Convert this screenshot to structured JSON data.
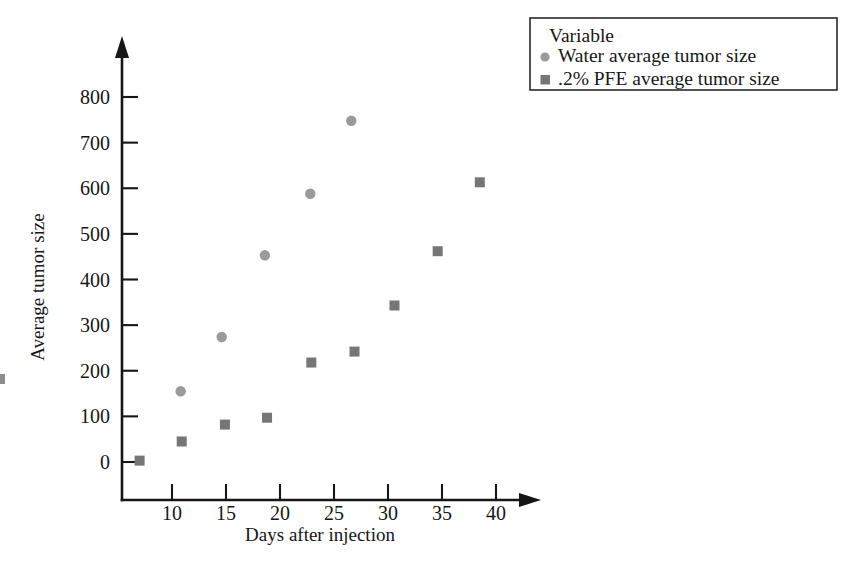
{
  "chart_data": {
    "type": "scatter",
    "title": "",
    "xlabel": "Days after injection",
    "ylabel": "Average tumor size",
    "xlim": [
      5,
      43
    ],
    "ylim": [
      -40,
      860
    ],
    "xticks": [
      10,
      15,
      20,
      25,
      30,
      35,
      40
    ],
    "yticks": [
      0,
      100,
      200,
      300,
      400,
      500,
      600,
      700,
      800
    ],
    "grid": false,
    "legend_position": "top-right",
    "legend_title": "Variable",
    "series": [
      {
        "name": "Water average tumor size",
        "marker": "circle",
        "color": "#9a9a9a",
        "points": [
          {
            "x": 10.8,
            "y": 155
          },
          {
            "x": 14.6,
            "y": 274
          },
          {
            "x": 18.6,
            "y": 453
          },
          {
            "x": 22.8,
            "y": 588
          },
          {
            "x": 26.6,
            "y": 748
          }
        ]
      },
      {
        "name": ".2% PFE average tumor size",
        "marker": "square",
        "color": "#767676",
        "points": [
          {
            "x": 7.0,
            "y": 3
          },
          {
            "x": 10.9,
            "y": 45
          },
          {
            "x": 14.9,
            "y": 82
          },
          {
            "x": 18.8,
            "y": 97
          },
          {
            "x": 22.9,
            "y": 218
          },
          {
            "x": 26.9,
            "y": 242
          },
          {
            "x": 30.6,
            "y": 343
          },
          {
            "x": 34.6,
            "y": 462
          },
          {
            "x": 38.5,
            "y": 613
          }
        ]
      }
    ]
  },
  "legend": {
    "title": "Variable",
    "entries": [
      {
        "label": "Water average tumor size",
        "marker": "circle",
        "color": "#9a9a9a"
      },
      {
        "label": ".2% PFE average tumor size",
        "marker": "square",
        "color": "#767676"
      }
    ]
  },
  "axes": {
    "x_title": "Days after injection",
    "y_title": "Average tumor size",
    "x_tick_labels": [
      "10",
      "15",
      "20",
      "25",
      "30",
      "35",
      "40"
    ],
    "y_tick_labels": [
      "0",
      "100",
      "200",
      "300",
      "400",
      "500",
      "600",
      "700",
      "800"
    ]
  }
}
